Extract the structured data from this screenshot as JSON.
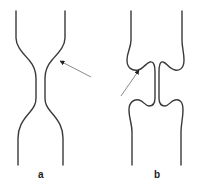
{
  "figure": {
    "panels": [
      {
        "id": "a",
        "label": "a",
        "description": "Smooth constriction (narrowing) of a channel with arrow pointing at the curved wall"
      },
      {
        "id": "b",
        "label": "b",
        "description": "Channel with sharp lobed/notched constriction, arrow pointing into the curl"
      }
    ]
  },
  "colors": {
    "line": "#3a3a3a",
    "arrow": "#8a8a8a",
    "background": "#ffffff"
  }
}
